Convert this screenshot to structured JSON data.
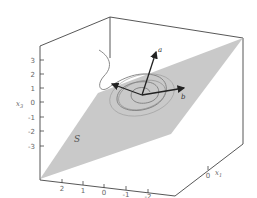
{
  "figure": {
    "type": "3d-diagram",
    "colors": {
      "plane": "#c8c8c8",
      "box_edges": "#444444",
      "spiral": "#7a7a7a",
      "vectors": "#222222",
      "tick_text": "#666666"
    },
    "plane_label": "S",
    "vectors": [
      {
        "name": "a",
        "label": "a"
      },
      {
        "name": "b",
        "label": "b"
      },
      {
        "name": "c",
        "label": ""
      }
    ],
    "axes": {
      "x3": {
        "label": "x",
        "subscript": "3",
        "ticks": [
          "3",
          "2",
          "1",
          "0",
          "-1",
          "-2",
          "-3"
        ]
      },
      "x2": {
        "label": "x",
        "subscript": "2",
        "ticks": [
          "2",
          "1",
          "0",
          "-1",
          "-2"
        ]
      },
      "x1": {
        "label": "x",
        "subscript": "1",
        "ticks": [
          "0"
        ]
      }
    }
  }
}
